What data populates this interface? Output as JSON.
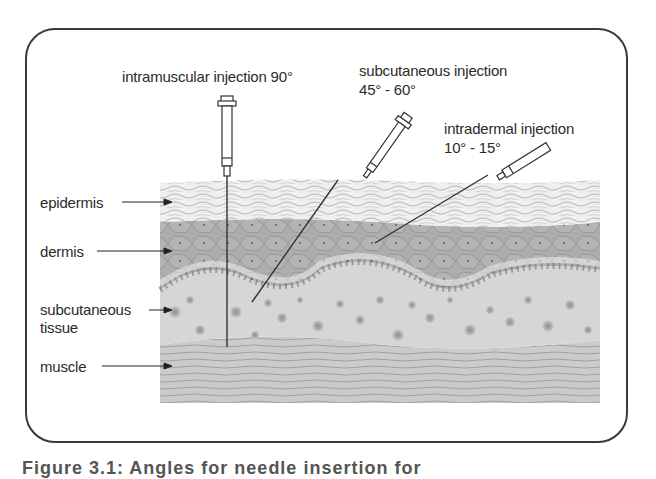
{
  "figure": {
    "injections": [
      {
        "name": "intramuscular",
        "label": "intramuscular injection 90°",
        "angle_deg": "90"
      },
      {
        "name": "subcutaneous",
        "label_line1": "subcutaneous injection",
        "label_line2": "45° - 60°",
        "angle_deg": "45-60"
      },
      {
        "name": "intradermal",
        "label_line1": "intradermal injection",
        "label_line2": "10° - 15°",
        "angle_deg": "10-15"
      }
    ],
    "layers": [
      {
        "label": "epidermis"
      },
      {
        "label": "dermis"
      },
      {
        "label_line1": "subcutaneous",
        "label_line2": "tissue"
      },
      {
        "label": "muscle"
      }
    ],
    "caption": "Figure 3.1: Angles for needle insertion for"
  },
  "colors": {
    "epidermis": "#e6e6e6",
    "dermis": "#a9a9a9",
    "subcutaneous": "#d4d4d4",
    "muscle": "#c9c9c9",
    "outline": "#3a3a3a"
  }
}
